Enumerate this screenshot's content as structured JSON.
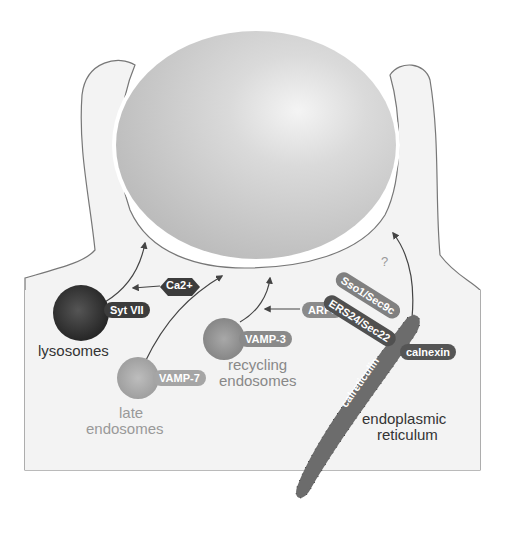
{
  "diagram": {
    "labels": {
      "lysosomes": "lysosomes",
      "late_endosomes_1": "late",
      "late_endosomes_2": "endosomes",
      "recycling_endosomes_1": "recycling",
      "recycling_endosomes_2": "endosomes",
      "er_1": "endoplasmic",
      "er_2": "reticulum",
      "question": "?"
    },
    "proteins": {
      "syt7": "Syt VII",
      "ca": "Ca2+",
      "vamp7": "VAMP-7",
      "vamp3": "VAMP-3",
      "arf6": "ARF6",
      "sso1": "Sso1/Sec9c",
      "ers24": "ERS24/Sec22",
      "calnexin": "calnexin",
      "calreticulin": "calreticulin"
    },
    "colors": {
      "cell": "#f3f3f3",
      "outline": "#777777",
      "particle": "#d2d2d2",
      "lysosome": "#3a3a3a",
      "late_endosome": "#a8a8a8",
      "recycling_endosome": "#8f8f8f",
      "er": "#6c6c6c",
      "pill_dark": "#3c3c3c",
      "pill_mid": "#707070",
      "pill_light": "#a5a5a5"
    }
  }
}
